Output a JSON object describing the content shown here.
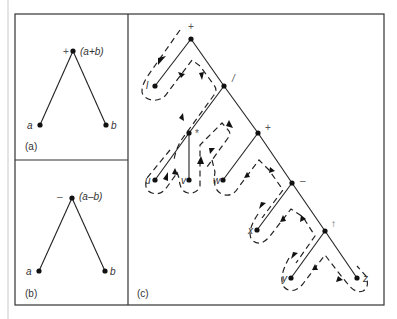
{
  "panels": {
    "a": {
      "caption": "(a)",
      "root_op": "+",
      "root_expr": "(a+b)",
      "leaf_left": "a",
      "leaf_right": "b"
    },
    "b": {
      "caption": "(b)",
      "root_op": "–",
      "root_expr": "(a–b)",
      "leaf_left": "a",
      "leaf_right": "b"
    },
    "c": {
      "caption": "(c)",
      "nodes": [
        {
          "id": "n_root",
          "label": "+"
        },
        {
          "id": "n_l",
          "label": "l"
        },
        {
          "id": "n_div",
          "label": "/"
        },
        {
          "id": "n_mul",
          "label": "*"
        },
        {
          "id": "n_u",
          "label": "u"
        },
        {
          "id": "n_v",
          "label": "v"
        },
        {
          "id": "n_plus",
          "label": "+"
        },
        {
          "id": "n_w",
          "label": "w"
        },
        {
          "id": "n_minus",
          "label": "–"
        },
        {
          "id": "n_x",
          "label": "x"
        },
        {
          "id": "n_pow",
          "label": "↑"
        },
        {
          "id": "n_y",
          "label": "y"
        },
        {
          "id": "n_z",
          "label": "z"
        }
      ]
    }
  }
}
